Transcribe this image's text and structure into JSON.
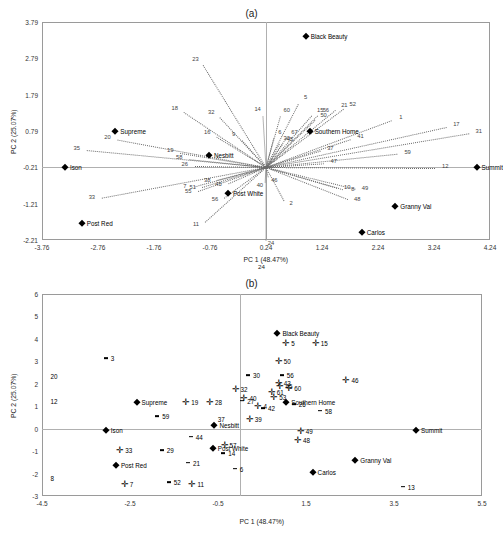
{
  "figure": {
    "panel_a_title": "(a)",
    "panel_b_title": "(b)"
  },
  "chart_data": [
    {
      "type": "scatter",
      "id": "panel-a",
      "title": "(a)",
      "xlabel": "PC  1 (48.47%)",
      "ylabel": "PC 2 (25.07%)",
      "xlabel_extra": "24",
      "xlim": [
        -3.76,
        4.24
      ],
      "ylim": [
        -2.21,
        3.79
      ],
      "xticks": [
        "-3.76",
        "-2.76",
        "-1.76",
        "-0.76",
        "0.24",
        "1.24",
        "2.24",
        "3.24",
        "4.24"
      ],
      "yticks": [
        "3.79",
        "2.79",
        "1.79",
        "0.79",
        "-0.21",
        "-1.21",
        "-2.21"
      ],
      "grid": false,
      "legend": "none",
      "origin": [
        0.24,
        -0.21
      ],
      "cultivars": [
        {
          "label": "Black Beauty",
          "x": 0.95,
          "y": 3.4,
          "side": "right"
        },
        {
          "label": "Supreme",
          "x": -2.45,
          "y": 0.79,
          "side": "right"
        },
        {
          "label": "Southern Home",
          "x": 1.02,
          "y": 0.79,
          "side": "right"
        },
        {
          "label": "Ison",
          "x": -3.35,
          "y": -0.21,
          "side": "right"
        },
        {
          "label": "Summit",
          "x": 4.0,
          "y": -0.21,
          "side": "right"
        },
        {
          "label": "Nesbitt",
          "x": -0.78,
          "y": 0.12,
          "side": "right"
        },
        {
          "label": "Post White",
          "x": -0.44,
          "y": -0.92,
          "side": "right"
        },
        {
          "label": "Post Red",
          "x": -3.05,
          "y": -1.75,
          "side": "right"
        },
        {
          "label": "Granny Val",
          "x": 2.55,
          "y": -1.28,
          "side": "right"
        },
        {
          "label": "Carlos",
          "x": 1.95,
          "y": -2.0,
          "side": "right"
        }
      ],
      "vectors": [
        {
          "n": "23",
          "x": -0.93,
          "y": 2.72
        },
        {
          "n": "18",
          "x": -1.3,
          "y": 1.38
        },
        {
          "n": "32",
          "x": -0.65,
          "y": 1.27
        },
        {
          "n": "14",
          "x": 0.18,
          "y": 1.34
        },
        {
          "n": "5",
          "x": 0.86,
          "y": 1.66
        },
        {
          "n": "60",
          "x": 0.52,
          "y": 1.32
        },
        {
          "n": "21",
          "x": 1.55,
          "y": 1.45
        },
        {
          "n": "52",
          "x": 1.7,
          "y": 1.48
        },
        {
          "n": "15",
          "x": 1.12,
          "y": 1.32
        },
        {
          "n": "56",
          "x": 1.22,
          "y": 1.3
        },
        {
          "n": "50",
          "x": 1.18,
          "y": 1.18
        },
        {
          "n": "1",
          "x": 2.56,
          "y": 1.12
        },
        {
          "n": "17",
          "x": 3.55,
          "y": 0.92
        },
        {
          "n": "31",
          "x": 3.95,
          "y": 0.74
        },
        {
          "n": "16",
          "x": -0.72,
          "y": 0.7
        },
        {
          "n": "9",
          "x": -0.25,
          "y": 0.64
        },
        {
          "n": "6",
          "x": 0.4,
          "y": 0.72
        },
        {
          "n": "67",
          "x": 0.66,
          "y": 0.72
        },
        {
          "n": "30",
          "x": 0.52,
          "y": 0.55
        },
        {
          "n": "45",
          "x": 0.58,
          "y": 0.52
        },
        {
          "n": "41",
          "x": 1.84,
          "y": 0.6
        },
        {
          "n": "20",
          "x": -2.5,
          "y": 0.57
        },
        {
          "n": "35",
          "x": -3.05,
          "y": 0.27
        },
        {
          "n": "19",
          "x": -1.38,
          "y": 0.2
        },
        {
          "n": "58",
          "x": -1.22,
          "y": 0.02
        },
        {
          "n": "26",
          "x": -1.12,
          "y": -0.18
        },
        {
          "n": "59",
          "x": 2.68,
          "y": 0.17
        },
        {
          "n": "37",
          "x": 1.3,
          "y": 0.28
        },
        {
          "n": "47",
          "x": 1.36,
          "y": -0.1
        },
        {
          "n": "12",
          "x": 3.35,
          "y": -0.24
        },
        {
          "n": "33",
          "x": -2.78,
          "y": -1.08
        },
        {
          "n": "7",
          "x": -1.12,
          "y": -0.78
        },
        {
          "n": "51",
          "x": -0.98,
          "y": -0.8
        },
        {
          "n": "55",
          "x": -1.06,
          "y": -0.92
        },
        {
          "n": "38",
          "x": -0.72,
          "y": -0.6
        },
        {
          "n": "45b",
          "x": -0.52,
          "y": -0.72
        },
        {
          "n": "46",
          "x": 0.3,
          "y": -0.62
        },
        {
          "n": "40",
          "x": 0.22,
          "y": -0.75
        },
        {
          "n": "10",
          "x": 1.6,
          "y": -0.82
        },
        {
          "n": "8",
          "x": 1.7,
          "y": -0.86
        },
        {
          "n": "49",
          "x": 1.92,
          "y": -0.84
        },
        {
          "n": "48",
          "x": 1.78,
          "y": -1.14
        },
        {
          "n": "56b",
          "x": -0.58,
          "y": -1.14
        },
        {
          "n": "2",
          "x": 0.6,
          "y": -1.24
        },
        {
          "n": "11",
          "x": -0.92,
          "y": -1.82
        },
        {
          "n": "24",
          "x": 0.24,
          "y": -2.35
        }
      ]
    },
    {
      "type": "scatter",
      "id": "panel-b",
      "title": "(b)",
      "xlabel": "PC 1 (48.47%)",
      "ylabel": "PC 2 (25.07%)",
      "xlim": [
        -4.5,
        5.5
      ],
      "ylim": [
        -3,
        6
      ],
      "xticks": [
        "-4.5",
        "-2.5",
        "-0.5",
        "1.5",
        "3.5",
        "5.5"
      ],
      "yticks": [
        "6",
        "5",
        "4",
        "3",
        "2",
        "1",
        "0",
        "-1",
        "-2",
        "-3"
      ],
      "grid": false,
      "legend": "none",
      "origin": [
        0.0,
        0.0
      ],
      "cultivars": [
        {
          "label": "Black Beauty",
          "x": 0.85,
          "y": 4.25,
          "side": "right"
        },
        {
          "label": "Supreme",
          "x": -2.35,
          "y": 1.2,
          "side": "right"
        },
        {
          "label": "Southern Home",
          "x": 1.05,
          "y": 1.2,
          "side": "right"
        },
        {
          "label": "Ison",
          "x": -3.05,
          "y": -0.05,
          "side": "right"
        },
        {
          "label": "Summit",
          "x": 4.0,
          "y": -0.05,
          "side": "right"
        },
        {
          "label": "Nesbitt",
          "x": -0.58,
          "y": 0.15,
          "side": "right"
        },
        {
          "label": "Post White",
          "x": -0.62,
          "y": -0.88,
          "side": "right"
        },
        {
          "label": "Post Red",
          "x": -2.82,
          "y": -1.62,
          "side": "right"
        },
        {
          "label": "Granny Val",
          "x": 2.62,
          "y": -1.38,
          "side": "right"
        },
        {
          "label": "Carlos",
          "x": 1.65,
          "y": -1.95,
          "side": "right"
        }
      ],
      "points": [
        {
          "n": "3",
          "x": -3.05,
          "y": 3.15,
          "m": "dash"
        },
        {
          "n": "5",
          "x": 1.05,
          "y": 3.8,
          "m": "plus"
        },
        {
          "n": "15",
          "x": 1.72,
          "y": 3.82,
          "m": "plus"
        },
        {
          "n": "50",
          "x": 0.88,
          "y": 3.0,
          "m": "plus"
        },
        {
          "n": "30",
          "x": 0.18,
          "y": 2.38,
          "m": "dash"
        },
        {
          "n": "56",
          "x": 0.95,
          "y": 2.38,
          "m": "dash"
        },
        {
          "n": "20",
          "x": -4.42,
          "y": 2.35,
          "m": "none"
        },
        {
          "n": "46",
          "x": 2.42,
          "y": 2.18,
          "m": "plus"
        },
        {
          "n": "32",
          "x": -0.1,
          "y": 1.78,
          "m": "plus"
        },
        {
          "n": "43",
          "x": 0.88,
          "y": 2.02,
          "m": "plus"
        },
        {
          "n": "45",
          "x": 0.92,
          "y": 1.88,
          "m": "plus"
        },
        {
          "n": "60",
          "x": 1.12,
          "y": 1.8,
          "m": "plus"
        },
        {
          "n": "61",
          "x": 0.72,
          "y": 1.62,
          "m": "plus"
        },
        {
          "n": "53",
          "x": 0.78,
          "y": 1.42,
          "m": "plus"
        },
        {
          "n": "40",
          "x": 0.1,
          "y": 1.38,
          "m": "plus"
        },
        {
          "n": "27",
          "x": 0.05,
          "y": 1.25,
          "m": "dash"
        },
        {
          "n": "12",
          "x": -4.42,
          "y": 1.22,
          "m": "none"
        },
        {
          "n": "19",
          "x": -1.22,
          "y": 1.2,
          "m": "plus"
        },
        {
          "n": "28",
          "x": -0.68,
          "y": 1.18,
          "m": "plus"
        },
        {
          "n": "26",
          "x": 1.22,
          "y": 1.08,
          "m": "dash"
        },
        {
          "n": "4",
          "x": 0.42,
          "y": 1.02,
          "m": "plus"
        },
        {
          "n": "42",
          "x": 0.52,
          "y": 0.9,
          "m": "dash"
        },
        {
          "n": "58",
          "x": 1.82,
          "y": 0.8,
          "m": "dash"
        },
        {
          "n": "59",
          "x": -1.88,
          "y": 0.55,
          "m": "dash"
        },
        {
          "n": "37",
          "x": -0.62,
          "y": 0.42,
          "m": "none"
        },
        {
          "n": "39",
          "x": 0.22,
          "y": 0.45,
          "m": "plus"
        },
        {
          "n": "49",
          "x": 1.38,
          "y": -0.1,
          "m": "plus"
        },
        {
          "n": "44",
          "x": -1.12,
          "y": -0.35,
          "m": "dash"
        },
        {
          "n": "48",
          "x": 1.32,
          "y": -0.52,
          "m": "plus"
        },
        {
          "n": "57",
          "x": -0.35,
          "y": -0.72,
          "m": "plus"
        },
        {
          "n": "33",
          "x": -2.72,
          "y": -0.95,
          "m": "plus"
        },
        {
          "n": "29",
          "x": -1.78,
          "y": -0.95,
          "m": "dash"
        },
        {
          "n": "14",
          "x": -0.38,
          "y": -1.08,
          "m": "dash"
        },
        {
          "n": "21",
          "x": -1.18,
          "y": -1.52,
          "m": "dash"
        },
        {
          "n": "6",
          "x": -0.12,
          "y": -1.78,
          "m": "dash"
        },
        {
          "n": "8",
          "x": -4.42,
          "y": -2.22,
          "m": "none"
        },
        {
          "n": "7",
          "x": -2.62,
          "y": -2.48,
          "m": "plus"
        },
        {
          "n": "52",
          "x": -1.62,
          "y": -2.38,
          "m": "dash"
        },
        {
          "n": "11",
          "x": -1.08,
          "y": -2.48,
          "m": "plus"
        },
        {
          "n": "13",
          "x": 3.7,
          "y": -2.58,
          "m": "dash"
        }
      ]
    }
  ]
}
